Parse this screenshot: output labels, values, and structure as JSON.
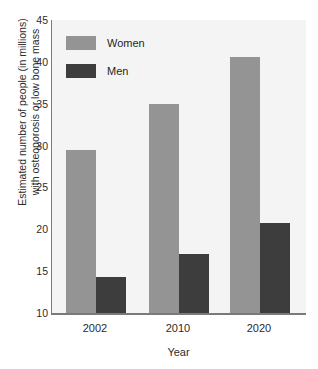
{
  "chart_data": {
    "type": "bar",
    "title": "",
    "categories": [
      "2002",
      "2010",
      "2020"
    ],
    "series": [
      {
        "name": "Women",
        "values": [
          29.5,
          35.0,
          40.6
        ],
        "color": "#949494"
      },
      {
        "name": "Men",
        "values": [
          14.3,
          17.0,
          20.8
        ],
        "color": "#3d3d3d"
      }
    ],
    "xlabel": "Year",
    "ylabel": "Estimated number of people (in millions) with osteoporosis or low bone mass",
    "ylabel_line1": "Estimated number of people (in millions)",
    "ylabel_line2": "with osteoporosis or low bone mass",
    "ylim": [
      10,
      45
    ],
    "yticks": [
      45,
      40,
      35,
      30,
      25,
      20,
      15,
      10
    ],
    "grid": false,
    "legend_position": "top-left",
    "plot_background": "#f4f4f4",
    "axis_color": "#7a7a7a"
  }
}
